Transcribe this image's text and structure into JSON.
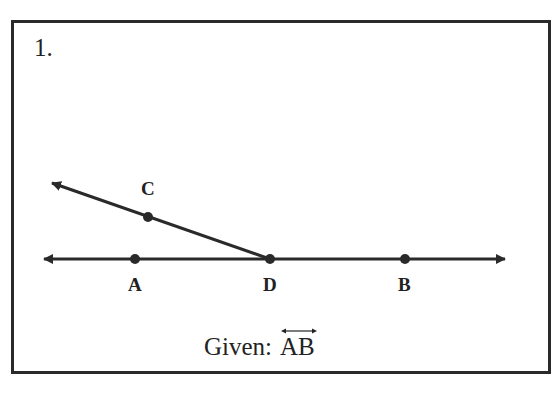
{
  "problem": {
    "number": "1.",
    "given_prefix": "Given:",
    "given_object": "AB",
    "given_notation": "line-symbol-overbar"
  },
  "figure": {
    "points": [
      {
        "name": "A",
        "x": 135,
        "y": 259
      },
      {
        "name": "D",
        "x": 270,
        "y": 259
      },
      {
        "name": "B",
        "x": 405,
        "y": 259
      },
      {
        "name": "C",
        "x": 148,
        "y": 217
      }
    ],
    "labels": {
      "A": "A",
      "B": "B",
      "C": "C",
      "D": "D"
    },
    "line_AB": {
      "type": "line",
      "from": [
        44,
        259
      ],
      "to": [
        505,
        259
      ],
      "arrows": "both"
    },
    "ray_DC": {
      "type": "ray",
      "origin": "D",
      "through": "C",
      "arrow_end": [
        50,
        182
      ]
    },
    "stroke_color": "#2a2a2a"
  }
}
